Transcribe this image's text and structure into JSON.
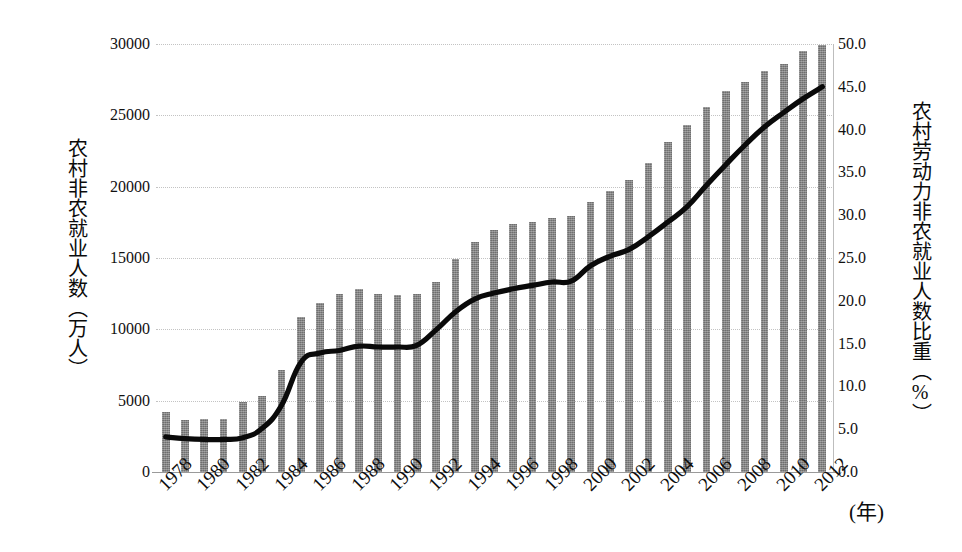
{
  "chart_data": {
    "type": "bar",
    "title": "",
    "subtitle": "",
    "xlabel": "(年)",
    "ylabel": "农村非农就业人数（万人）",
    "y2label": "农村劳动力非农就业人数比重（%）",
    "grid": true,
    "legend": "none",
    "xlim": [
      1978,
      2012
    ],
    "ylim": [
      0,
      30000
    ],
    "y2lim": [
      0,
      50
    ],
    "x": [
      1978,
      1979,
      1980,
      1981,
      1982,
      1983,
      1984,
      1985,
      1986,
      1987,
      1988,
      1989,
      1990,
      1991,
      1992,
      1993,
      1994,
      1995,
      1996,
      1997,
      1998,
      1999,
      2000,
      2001,
      2002,
      2003,
      2004,
      2005,
      2006,
      2007,
      2008,
      2009,
      2010,
      2011,
      2012
    ],
    "x_tick_labels": [
      "1978",
      "1980",
      "1982",
      "1984",
      "1986",
      "1988",
      "1990",
      "1992",
      "1994",
      "1996",
      "1998",
      "2000",
      "2002",
      "2004",
      "2006",
      "2008",
      "2010",
      "2012"
    ],
    "y_tick_labels": [
      "30000",
      "25000",
      "20000",
      "15000",
      "10000",
      "5000",
      "0"
    ],
    "y2_tick_labels": [
      "50.0",
      "45.0",
      "40.0",
      "35.0",
      "30.0",
      "25.0",
      "20.0",
      "15.0",
      "10.0",
      "5.0",
      "0.0"
    ],
    "series": [
      {
        "name": "农村非农就业人数（万人）",
        "type": "bar",
        "axis": "left",
        "color": "#7d7d7d",
        "values": [
          4200,
          3650,
          3700,
          3750,
          4900,
          5350,
          7150,
          10850,
          11850,
          12450,
          12850,
          12450,
          12400,
          12450,
          13350,
          14900,
          16150,
          16950,
          17350,
          17550,
          17800,
          17950,
          18950,
          19700,
          20450,
          21650,
          23100,
          24350,
          25600,
          26700,
          27350,
          28100,
          28600,
          29500,
          29950
        ]
      },
      {
        "name": "农村劳动力非农就业人数比重（%）",
        "type": "line",
        "axis": "right",
        "color": "#0a0a0a",
        "values": [
          4.1,
          3.9,
          3.8,
          3.8,
          4.0,
          5.1,
          7.8,
          12.8,
          13.9,
          14.2,
          14.7,
          14.6,
          14.6,
          14.8,
          16.6,
          18.7,
          20.2,
          20.9,
          21.4,
          21.8,
          22.2,
          22.3,
          24.1,
          25.2,
          26.0,
          27.5,
          29.2,
          31.0,
          33.5,
          35.9,
          38.2,
          40.3,
          42.0,
          43.6,
          45.0
        ]
      }
    ]
  }
}
